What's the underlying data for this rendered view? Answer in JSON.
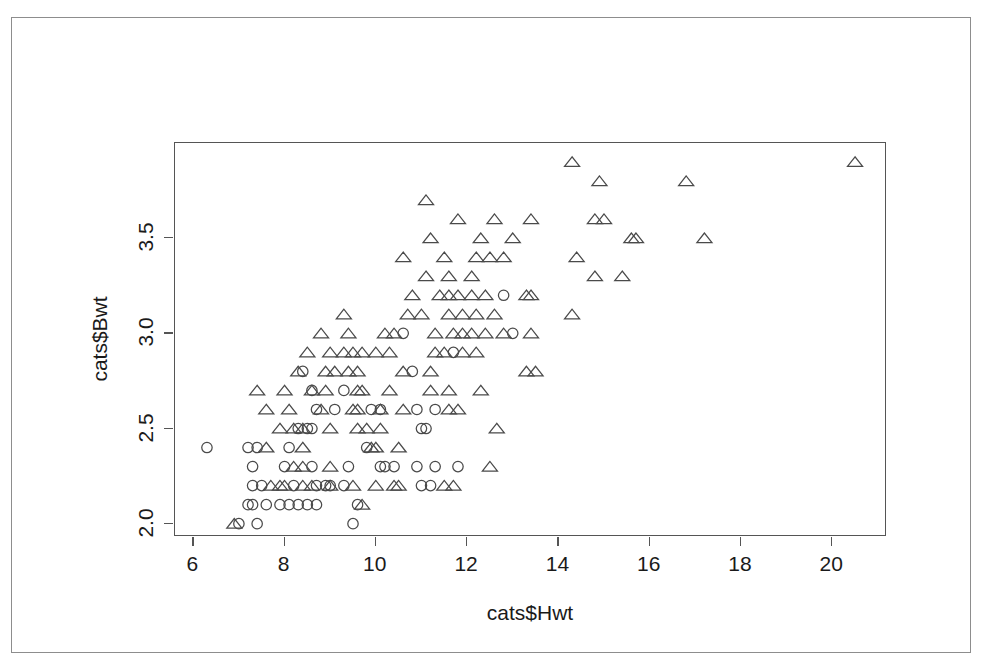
{
  "chart_data": {
    "type": "scatter",
    "title": "",
    "xlabel": "cats$Hwt",
    "ylabel": "cats$Bwt",
    "xlim": [
      5.6,
      21.2
    ],
    "ylim": [
      1.93,
      4.0
    ],
    "xticks": [
      6,
      8,
      10,
      12,
      14,
      16,
      18,
      20
    ],
    "xtick_labels": [
      "6",
      "8",
      "10",
      "12",
      "14",
      "16",
      "18",
      "20"
    ],
    "yticks": [
      2.0,
      2.5,
      3.0,
      3.5
    ],
    "ytick_labels": [
      "2.0",
      "2.5",
      "3.0",
      "3.5"
    ],
    "grid": false,
    "legend": "none",
    "box": true,
    "series": [
      {
        "name": "female",
        "marker": "circle",
        "color": "#4a4a4a",
        "points": [
          [
            6.3,
            2.4
          ],
          [
            7.0,
            2.0
          ],
          [
            7.4,
            2.0
          ],
          [
            7.3,
            2.1
          ],
          [
            7.2,
            2.1
          ],
          [
            7.6,
            2.1
          ],
          [
            7.9,
            2.1
          ],
          [
            8.1,
            2.1
          ],
          [
            8.3,
            2.1
          ],
          [
            8.5,
            2.1
          ],
          [
            8.7,
            2.1
          ],
          [
            9.5,
            2.0
          ],
          [
            9.6,
            2.1
          ],
          [
            7.3,
            2.2
          ],
          [
            7.5,
            2.2
          ],
          [
            8.2,
            2.2
          ],
          [
            8.7,
            2.2
          ],
          [
            8.9,
            2.2
          ],
          [
            9.0,
            2.2
          ],
          [
            9.3,
            2.2
          ],
          [
            11.0,
            2.2
          ],
          [
            11.2,
            2.2
          ],
          [
            7.3,
            2.3
          ],
          [
            8.0,
            2.3
          ],
          [
            8.6,
            2.3
          ],
          [
            9.4,
            2.3
          ],
          [
            10.1,
            2.3
          ],
          [
            10.2,
            2.3
          ],
          [
            10.4,
            2.3
          ],
          [
            10.9,
            2.3
          ],
          [
            11.3,
            2.3
          ],
          [
            11.8,
            2.3
          ],
          [
            7.2,
            2.4
          ],
          [
            7.4,
            2.4
          ],
          [
            8.1,
            2.4
          ],
          [
            9.8,
            2.4
          ],
          [
            8.3,
            2.5
          ],
          [
            8.5,
            2.5
          ],
          [
            8.6,
            2.5
          ],
          [
            11.0,
            2.5
          ],
          [
            11.1,
            2.5
          ],
          [
            8.7,
            2.6
          ],
          [
            9.1,
            2.6
          ],
          [
            9.9,
            2.6
          ],
          [
            10.1,
            2.6
          ],
          [
            10.9,
            2.6
          ],
          [
            11.3,
            2.6
          ],
          [
            8.6,
            2.7
          ],
          [
            9.3,
            2.7
          ],
          [
            8.4,
            2.8
          ],
          [
            10.8,
            2.8
          ],
          [
            11.7,
            2.9
          ],
          [
            10.6,
            3.0
          ],
          [
            13.0,
            3.0
          ],
          [
            12.8,
            3.2
          ]
        ]
      },
      {
        "name": "male",
        "marker": "triangle",
        "color": "#4a4a4a",
        "points": [
          [
            6.9,
            2.0
          ],
          [
            9.7,
            2.1
          ],
          [
            7.7,
            2.2
          ],
          [
            7.9,
            2.2
          ],
          [
            8.0,
            2.2
          ],
          [
            8.4,
            2.2
          ],
          [
            8.6,
            2.2
          ],
          [
            9.0,
            2.2
          ],
          [
            9.5,
            2.2
          ],
          [
            10.0,
            2.2
          ],
          [
            10.4,
            2.2
          ],
          [
            10.5,
            2.2
          ],
          [
            11.5,
            2.2
          ],
          [
            11.7,
            2.2
          ],
          [
            8.2,
            2.3
          ],
          [
            8.4,
            2.3
          ],
          [
            9.0,
            2.3
          ],
          [
            12.5,
            2.3
          ],
          [
            7.6,
            2.4
          ],
          [
            8.4,
            2.4
          ],
          [
            9.9,
            2.4
          ],
          [
            10.0,
            2.4
          ],
          [
            10.5,
            2.4
          ],
          [
            7.9,
            2.5
          ],
          [
            8.2,
            2.5
          ],
          [
            8.4,
            2.5
          ],
          [
            9.0,
            2.5
          ],
          [
            9.6,
            2.5
          ],
          [
            9.8,
            2.5
          ],
          [
            10.1,
            2.5
          ],
          [
            12.65,
            2.5
          ],
          [
            7.6,
            2.6
          ],
          [
            8.1,
            2.6
          ],
          [
            8.8,
            2.6
          ],
          [
            9.5,
            2.6
          ],
          [
            9.6,
            2.6
          ],
          [
            10.1,
            2.6
          ],
          [
            10.6,
            2.6
          ],
          [
            11.6,
            2.6
          ],
          [
            11.8,
            2.6
          ],
          [
            7.4,
            2.7
          ],
          [
            8.0,
            2.7
          ],
          [
            8.6,
            2.7
          ],
          [
            8.9,
            2.7
          ],
          [
            9.6,
            2.7
          ],
          [
            9.7,
            2.7
          ],
          [
            10.3,
            2.7
          ],
          [
            11.2,
            2.7
          ],
          [
            11.6,
            2.7
          ],
          [
            12.3,
            2.7
          ],
          [
            8.3,
            2.8
          ],
          [
            8.9,
            2.8
          ],
          [
            9.1,
            2.8
          ],
          [
            9.4,
            2.8
          ],
          [
            9.6,
            2.8
          ],
          [
            10.6,
            2.8
          ],
          [
            11.2,
            2.8
          ],
          [
            13.3,
            2.8
          ],
          [
            13.5,
            2.8
          ],
          [
            8.5,
            2.9
          ],
          [
            9.0,
            2.9
          ],
          [
            9.3,
            2.9
          ],
          [
            9.5,
            2.9
          ],
          [
            9.7,
            2.9
          ],
          [
            10.0,
            2.9
          ],
          [
            10.3,
            2.9
          ],
          [
            11.3,
            2.9
          ],
          [
            11.5,
            2.9
          ],
          [
            11.9,
            2.9
          ],
          [
            12.2,
            2.9
          ],
          [
            8.8,
            3.0
          ],
          [
            9.4,
            3.0
          ],
          [
            10.2,
            3.0
          ],
          [
            10.4,
            3.0
          ],
          [
            11.3,
            3.0
          ],
          [
            11.7,
            3.0
          ],
          [
            11.9,
            3.0
          ],
          [
            12.1,
            3.0
          ],
          [
            12.4,
            3.0
          ],
          [
            12.8,
            3.0
          ],
          [
            13.4,
            3.0
          ],
          [
            9.3,
            3.1
          ],
          [
            10.7,
            3.1
          ],
          [
            11.0,
            3.1
          ],
          [
            11.6,
            3.1
          ],
          [
            11.9,
            3.1
          ],
          [
            12.2,
            3.1
          ],
          [
            12.6,
            3.1
          ],
          [
            14.3,
            3.1
          ],
          [
            10.8,
            3.2
          ],
          [
            11.4,
            3.2
          ],
          [
            11.6,
            3.2
          ],
          [
            11.8,
            3.2
          ],
          [
            12.1,
            3.2
          ],
          [
            12.4,
            3.2
          ],
          [
            13.3,
            3.2
          ],
          [
            13.4,
            3.2
          ],
          [
            11.1,
            3.3
          ],
          [
            11.6,
            3.3
          ],
          [
            12.1,
            3.3
          ],
          [
            14.8,
            3.3
          ],
          [
            15.4,
            3.3
          ],
          [
            10.6,
            3.4
          ],
          [
            11.5,
            3.4
          ],
          [
            12.2,
            3.4
          ],
          [
            12.5,
            3.4
          ],
          [
            12.8,
            3.4
          ],
          [
            14.4,
            3.4
          ],
          [
            11.2,
            3.5
          ],
          [
            12.3,
            3.5
          ],
          [
            13.0,
            3.5
          ],
          [
            15.6,
            3.5
          ],
          [
            15.7,
            3.5
          ],
          [
            17.2,
            3.5
          ],
          [
            11.8,
            3.6
          ],
          [
            12.6,
            3.6
          ],
          [
            13.4,
            3.6
          ],
          [
            14.8,
            3.6
          ],
          [
            15.0,
            3.6
          ],
          [
            11.1,
            3.7
          ],
          [
            14.9,
            3.8
          ],
          [
            16.8,
            3.8
          ],
          [
            14.3,
            3.9
          ],
          [
            20.5,
            3.9
          ]
        ]
      }
    ]
  }
}
